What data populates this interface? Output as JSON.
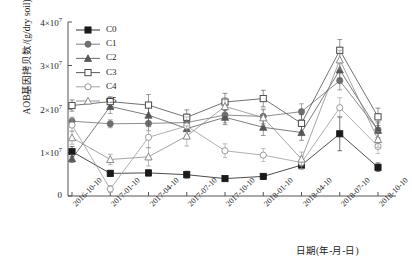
{
  "figure": {
    "cropped_header_text": "",
    "xlabel": "日期(年-月-日)",
    "ylabel": "AOB基因拷贝数/(g/dry soil)"
  },
  "axis": {
    "y_ticks": [
      {
        "label": "0",
        "mantissa": "0",
        "exponent": ""
      },
      {
        "label": "1×10⁷",
        "mantissa": "1×10",
        "exponent": "7"
      },
      {
        "label": "2×10⁷",
        "mantissa": "2×10",
        "exponent": "7"
      },
      {
        "label": "3×10⁷",
        "mantissa": "3×10",
        "exponent": "7"
      },
      {
        "label": "4×10⁷",
        "mantissa": "4×10",
        "exponent": "7"
      }
    ],
    "x_ticks": [
      "2016-10-10",
      "2017-01-10",
      "2017-04-10",
      "2017-07-10",
      "2017-10-10",
      "2018-01-10",
      "2018-04-10",
      "2018-07-10",
      "2018-10-10"
    ]
  },
  "legend": {
    "position": "top-left-inside",
    "entries": [
      {
        "label": "C0",
        "marker": "filled-square",
        "color": "#1a1a1a"
      },
      {
        "label": "C1",
        "marker": "filled-circle",
        "color": "#6e6e6e"
      },
      {
        "label": "C2",
        "marker": "filled-triangle",
        "color": "#585858"
      },
      {
        "label": "C3",
        "marker": "open-square",
        "color": "#4a4a4a"
      },
      {
        "label": "C4",
        "marker": "open-circle",
        "color": "#9a9a9a"
      },
      {
        "label": "C5",
        "marker": "open-triangle",
        "color": "#8a8a8a"
      }
    ]
  },
  "chart_data": {
    "type": "line",
    "title": "",
    "xlabel": "日期(年-月-日)",
    "ylabel": "AOB基因拷贝数/(g/dry soil)",
    "x": [
      "2016-10-10",
      "2017-01-10",
      "2017-04-10",
      "2017-07-10",
      "2017-10-10",
      "2018-01-10",
      "2018-04-10",
      "2018-07-10",
      "2018-10-10"
    ],
    "ylim": [
      0,
      40000000
    ],
    "y_tick_values": [
      0,
      10000000,
      20000000,
      30000000,
      40000000
    ],
    "grid": false,
    "error_bars": true,
    "series": [
      {
        "name": "C0",
        "marker": "filled-square",
        "color": "#1a1a1a",
        "values": [
          10200000,
          5200000,
          5300000,
          4900000,
          4000000,
          4500000,
          7100000,
          14300000,
          6600000
        ],
        "errors": [
          1200000,
          700000,
          700000,
          800000,
          600000,
          700000,
          900000,
          3900000,
          1000000
        ]
      },
      {
        "name": "C1",
        "marker": "filled-circle",
        "color": "#6e6e6e",
        "values": [
          17200000,
          16600000,
          16700000,
          16900000,
          18600000,
          18300000,
          19400000,
          26500000,
          15200000
        ],
        "errors": [
          900000,
          900000,
          1700000,
          1900000,
          1800000,
          1700000,
          1800000,
          2100000,
          1900000
        ]
      },
      {
        "name": "C2",
        "marker": "filled-triangle",
        "color": "#585858",
        "values": [
          8600000,
          20600000,
          18600000,
          15500000,
          18100000,
          15800000,
          14600000,
          29000000,
          15100000
        ],
        "errors": [
          900000,
          1600000,
          2600000,
          2000000,
          1700000,
          1900000,
          1800000,
          1900000,
          1700000
        ]
      },
      {
        "name": "C3",
        "marker": "open-square",
        "color": "#4a4a4a",
        "values": [
          20800000,
          21700000,
          20900000,
          18100000,
          21600000,
          22400000,
          16700000,
          33500000,
          18200000
        ],
        "errors": [
          1300000,
          1100000,
          2400000,
          1700000,
          2000000,
          1900000,
          2000000,
          2500000,
          2000000
        ]
      },
      {
        "name": "C4",
        "marker": "open-circle",
        "color": "#9a9a9a",
        "values": [
          16300000,
          1600000,
          13500000,
          16100000,
          10400000,
          9400000,
          7700000,
          20300000,
          11400000
        ],
        "errors": [
          1400000,
          800000,
          2400000,
          2100000,
          1600000,
          1500000,
          1400000,
          2300000,
          1600000
        ]
      },
      {
        "name": "C5",
        "marker": "open-triangle",
        "color": "#8a8a8a",
        "values": [
          13400000,
          8400000,
          9000000,
          13800000,
          20600000,
          18000000,
          8500000,
          31300000,
          13000000
        ],
        "errors": [
          1500000,
          1200000,
          2100000,
          2300000,
          2000000,
          1800000,
          1600000,
          2200000,
          1800000
        ]
      }
    ]
  }
}
